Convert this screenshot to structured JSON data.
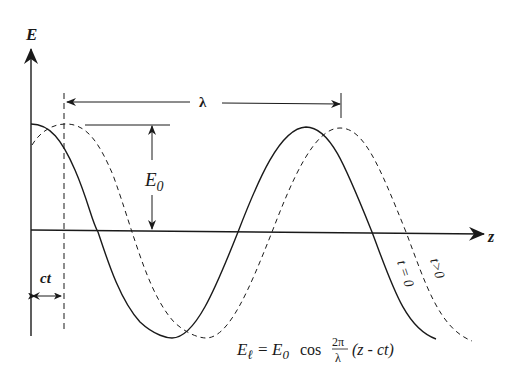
{
  "diagram": {
    "axes": {
      "vertical_label": "E",
      "horizontal_label": "z"
    },
    "labels": {
      "wavelength": "λ",
      "amplitude": "E",
      "amplitude_sub": "0",
      "displacement": "ct",
      "curve_t0": "t = 0",
      "curve_tgt0": "t>0"
    },
    "formula": {
      "lhs": "E",
      "lhs_sub": "ℓ",
      "eq": "=",
      "amp": "E",
      "amp_sub": "0",
      "func": "cos",
      "frac_num": "2π",
      "frac_den": "λ",
      "arg": "(z - ct)"
    },
    "colors": {
      "ink": "#1a1a1a",
      "background": "#ffffff"
    }
  }
}
